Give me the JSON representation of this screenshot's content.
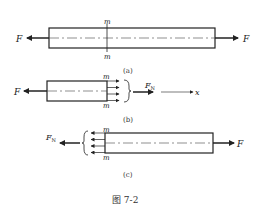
{
  "figure": {
    "caption": "图 7-2",
    "panels": {
      "a": {
        "label": "(a)",
        "force_left": "F",
        "force_right": "F",
        "section_top": "m",
        "section_bottom": "m"
      },
      "b": {
        "label": "(b)",
        "force_left": "F",
        "section_top": "m",
        "section_bottom": "m",
        "internal_force": "F",
        "internal_force_sub": "N",
        "axis": "x"
      },
      "c": {
        "label": "(c)",
        "internal_force": "F",
        "internal_force_sub": "N",
        "section_top": "m",
        "section_bottom": "m",
        "force_right": "F"
      }
    }
  }
}
